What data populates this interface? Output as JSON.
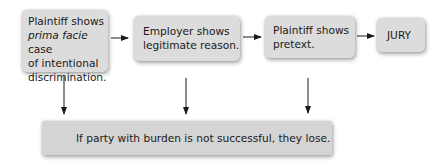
{
  "diagram": {
    "type": "flowchart",
    "colors": {
      "box_fill": "#dcdcdc",
      "bottom_box_fill": "#d4d4d4",
      "arrow": "#1a1a1a",
      "text": "#1a1a1a"
    },
    "steps": [
      {
        "id": "step1",
        "lines": [
          "Plaintiff shows",
          "prima facie case",
          "of intentional",
          "discrimination."
        ],
        "line2_prefix_italic": "prima facie",
        "line2_rest": " case"
      },
      {
        "id": "step2",
        "lines": [
          "Employer shows",
          "legitimate reason."
        ]
      },
      {
        "id": "step3",
        "lines": [
          "Plaintiff shows",
          "pretext."
        ]
      },
      {
        "id": "step4",
        "lines": [
          "JURY"
        ]
      }
    ],
    "outcome": {
      "id": "outcome",
      "text": "If party with burden is not successful, they lose."
    },
    "edges": [
      {
        "from": "step1",
        "to": "step2"
      },
      {
        "from": "step2",
        "to": "step3"
      },
      {
        "from": "step3",
        "to": "step4"
      },
      {
        "from": "step1",
        "to": "outcome"
      },
      {
        "from": "step2",
        "to": "outcome"
      },
      {
        "from": "step3",
        "to": "outcome"
      }
    ]
  }
}
